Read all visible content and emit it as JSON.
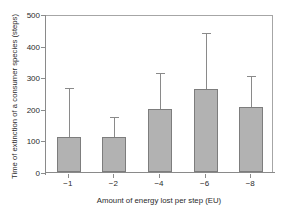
{
  "chart_data": {
    "type": "bar",
    "title": "",
    "xlabel": "Amount of energy lost per step (EU)",
    "ylabel": "Time of extinction of a consumer species (steps)",
    "categories": [
      "−1",
      "−2",
      "−4",
      "−6",
      "−8"
    ],
    "values": [
      112,
      110,
      200,
      264,
      205
    ],
    "errors_upper": [
      152,
      62,
      111,
      174,
      96
    ],
    "error_tops": [
      264,
      172,
      311,
      438,
      301
    ],
    "ylim": [
      0,
      500
    ],
    "yticks": [
      0,
      100,
      200,
      300,
      400,
      500
    ],
    "ytick_labels": [
      "0",
      "100",
      "200",
      "300",
      "400",
      "500"
    ],
    "grid": false,
    "legend": null,
    "bar_color": "#b2b2b2",
    "bar_edge_color": "#7d7d7d",
    "axis_color": "#8a8a8a",
    "error_bar_color": "#8a8a8a",
    "error_style": "upper-only",
    "series": [
      {
        "name": "Time of extinction",
        "values": [
          112,
          110,
          200,
          264,
          205
        ]
      }
    ]
  }
}
